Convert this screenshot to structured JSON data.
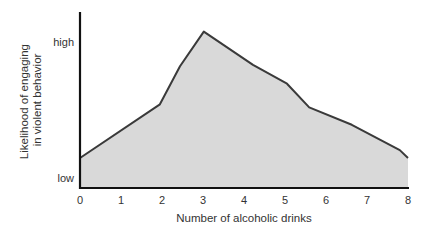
{
  "chart_data": {
    "type": "area",
    "title": "",
    "xlabel": "Number of alcoholic drinks",
    "ylabel_lines": [
      "Likelihood of engaging",
      "in violent behavior"
    ],
    "ylabel": "Likelihood of engaging in violent behavior",
    "x_ticks": [
      "0",
      "1",
      "2",
      "3",
      "4",
      "5",
      "6",
      "7",
      "8"
    ],
    "y_ticks": [
      {
        "label": "high",
        "value": 92
      },
      {
        "label": "low",
        "value": 0
      }
    ],
    "xlim": [
      0,
      8
    ],
    "ylim": [
      0,
      100
    ],
    "grid": false,
    "legend": null,
    "series": [
      {
        "name": "Likelihood",
        "x": [
          0,
          1.95,
          2.44,
          3.02,
          4.22,
          5.05,
          5.59,
          6.63,
          7.8,
          8
        ],
        "values": [
          19,
          53,
          77,
          99,
          78,
          66,
          51,
          40,
          24,
          19
        ]
      }
    ],
    "colors": {
      "fill": "#d9d9d9",
      "line": "#3a3a3a",
      "axis": "#111111"
    }
  }
}
